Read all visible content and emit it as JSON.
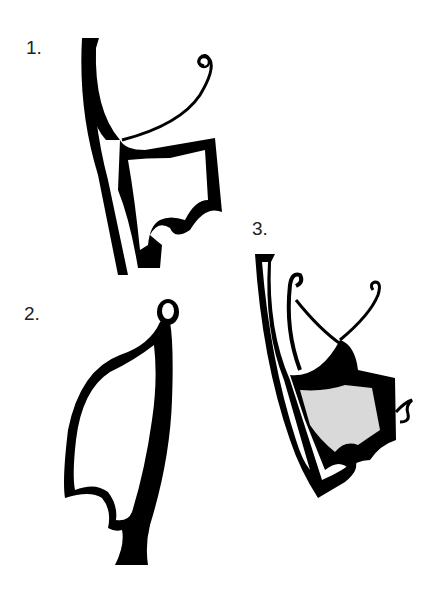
{
  "figures": [
    {
      "number": "1.",
      "description": "tall vertical band with spiral-tipped curl and shaded trapezoid body with notched base"
    },
    {
      "number": "2.",
      "description": "bulbous knob-topped leaf/sail form with scalloped base and foot"
    },
    {
      "number": "3.",
      "description": "vertical band with two spiral tendrils, shaded body, scalloped lower edge and small side curl"
    }
  ],
  "colors": {
    "ink": "#000000",
    "paper": "#ffffff"
  }
}
